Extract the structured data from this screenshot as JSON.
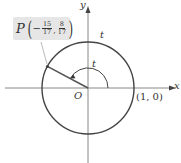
{
  "figure": {
    "point_label": "P",
    "point_x_num": "15",
    "point_x_den": "17",
    "point_x_sign": "−",
    "point_y_num": "8",
    "point_y_den": "17",
    "angle_label_outer": "t",
    "angle_label_inner": "t",
    "origin_label": "O",
    "unit_point_label": "(1, 0)",
    "x_axis_label": "x",
    "y_axis_label": "y",
    "colors": {
      "circle": "#444444",
      "axes": "#888888",
      "radius": "#555555",
      "label_box": "#e6e6e6"
    }
  }
}
